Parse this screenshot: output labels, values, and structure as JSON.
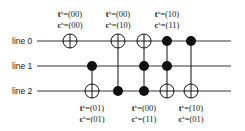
{
  "diagram": {
    "type": "reversible-circuit",
    "lines": [
      {
        "label": "line 0",
        "y": 41
      },
      {
        "label": "line 1",
        "y": 66
      },
      {
        "label": "line 2",
        "y": 91
      }
    ],
    "wire_x_start": 37,
    "wire_x_end": 231,
    "gates": [
      {
        "x": 70,
        "target": 0,
        "controls": [],
        "label_pos": "top",
        "t": "(00)",
        "c": "(00)"
      },
      {
        "x": 92,
        "target": 2,
        "controls": [
          1
        ],
        "label_pos": "bottom",
        "t": "(01)",
        "c": "(01)"
      },
      {
        "x": 118,
        "target": 0,
        "controls": [
          2
        ],
        "label_pos": "top",
        "t": "(00)",
        "c": "(10)"
      },
      {
        "x": 144,
        "target": 0,
        "controls": [
          1,
          2
        ],
        "label_pos": "bottom",
        "t": "(00)",
        "c": "(11)"
      },
      {
        "x": 167,
        "target": 2,
        "controls": [
          0,
          1
        ],
        "label_pos": "top",
        "t": "(10)",
        "c": "(11)"
      },
      {
        "x": 191,
        "target": 2,
        "controls": [
          0
        ],
        "label_pos": "bottom",
        "t": "(10)",
        "c": "(01)"
      }
    ],
    "label_prefix_t": "t",
    "label_prefix_c": "c",
    "label_superscript": "k",
    "colors": {
      "wire": "#333333",
      "gate": "#111111",
      "text": "#222222"
    }
  }
}
